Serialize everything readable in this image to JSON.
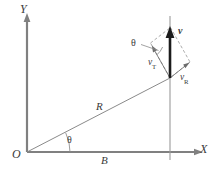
{
  "figure": {
    "background_color": "#ffffff",
    "axis_color": "#808080",
    "vector_color": "#1c1c1c",
    "dash_color": "#9c9c9c",
    "labels": {
      "y_axis": "Y",
      "x_axis": "X",
      "origin": "O",
      "radius": "R",
      "baseline": "B",
      "angle_origin": "θ",
      "angle_vector": "θ",
      "velocity": "v",
      "transverse_symbol": "v",
      "transverse_subscript": "T",
      "radial_symbol": "v",
      "radial_subscript": "R"
    },
    "geometry": {
      "origin": [
        27,
        152
      ],
      "point": [
        170,
        78
      ],
      "y_axis_top": [
        27,
        14
      ],
      "x_axis_right": [
        203,
        152
      ],
      "vertical_line_top": [
        170,
        14
      ],
      "vector_tip": [
        170,
        28
      ],
      "angle_degrees": 27
    }
  }
}
